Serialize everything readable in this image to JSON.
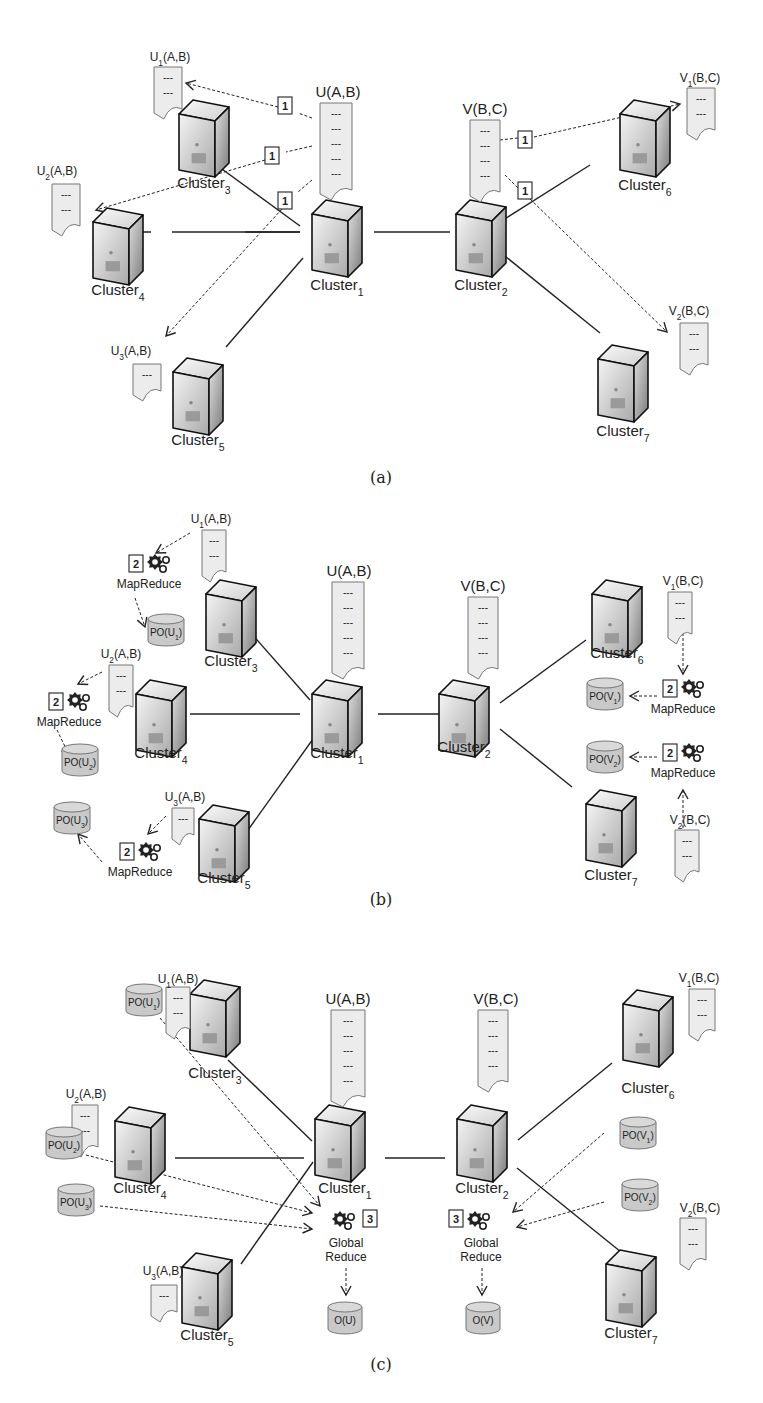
{
  "header_fragment": "",
  "panels": [
    {
      "id": "a",
      "caption": "(a)",
      "clusters": [
        {
          "id": "c1",
          "name": "Cluster",
          "sub": "1"
        },
        {
          "id": "c2",
          "name": "Cluster",
          "sub": "2"
        },
        {
          "id": "c3",
          "name": "Cluster",
          "sub": "3"
        },
        {
          "id": "c4",
          "name": "Cluster",
          "sub": "4"
        },
        {
          "id": "c5",
          "name": "Cluster",
          "sub": "5"
        },
        {
          "id": "c6",
          "name": "Cluster",
          "sub": "6"
        },
        {
          "id": "c7",
          "name": "Cluster",
          "sub": "7"
        }
      ],
      "documents": [
        {
          "id": "U",
          "label": "U(A,B)",
          "rows": 5
        },
        {
          "id": "V",
          "label": "V(B,C)",
          "rows": 4
        },
        {
          "id": "U1",
          "base": "U",
          "sub": "1",
          "args": "(A,B)",
          "rows": 2
        },
        {
          "id": "U2",
          "base": "U",
          "sub": "2",
          "args": "(A,B)",
          "rows": 2
        },
        {
          "id": "U3",
          "base": "U",
          "sub": "3",
          "args": "(A,B)",
          "rows": 1
        },
        {
          "id": "V1",
          "base": "V",
          "sub": "1",
          "args": "(B,C)",
          "rows": 2
        },
        {
          "id": "V2",
          "base": "V",
          "sub": "2",
          "args": "(B,C)",
          "rows": 2
        }
      ],
      "step_badge": "1"
    },
    {
      "id": "b",
      "caption": "(b)",
      "step_badge": "2",
      "task_label": "MapReduce",
      "partial_outputs": [
        {
          "base": "PO(U",
          "sub": "1",
          "close": ")"
        },
        {
          "base": "PO(U",
          "sub": "2",
          "close": ")"
        },
        {
          "base": "PO(U",
          "sub": "3",
          "close": ")"
        },
        {
          "base": "PO(V",
          "sub": "1",
          "close": ")"
        },
        {
          "base": "PO(V",
          "sub": "2",
          "close": ")"
        }
      ]
    },
    {
      "id": "c",
      "caption": "(c)",
      "step_badge": "3",
      "task_label_line1": "Global",
      "task_label_line2": "Reduce",
      "outputs": [
        "O(U)",
        "O(V)"
      ]
    }
  ],
  "dash": "---",
  "colors": {
    "doc_fill": "#ececec",
    "db_fill": "#c9c9c9",
    "line": "#222222",
    "server_light": "#f0f0f0",
    "server_dark": "#8a8a8a"
  }
}
